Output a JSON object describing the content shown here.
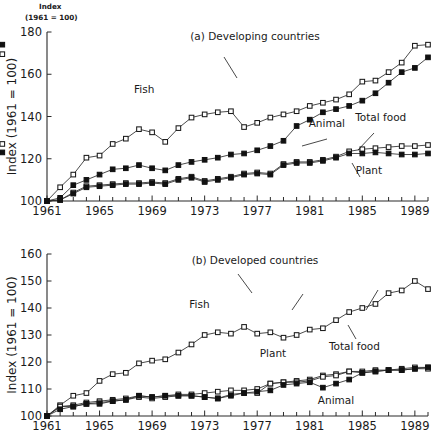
{
  "header": {
    "line1": "Index",
    "line2": "(1961 = 100)"
  },
  "chart_data": [
    {
      "type": "line",
      "id": "panel-a",
      "title": "(a) Developing countries",
      "xlabel": "",
      "ylabel": "Index (1961 = 100)",
      "xlim": [
        1961,
        1990
      ],
      "ylim": [
        100,
        180
      ],
      "yticks": [
        100,
        120,
        140,
        160,
        180
      ],
      "xticks": [
        1961,
        1965,
        1969,
        1973,
        1977,
        1981,
        1985,
        1989
      ],
      "xtick_labels": [
        "1961",
        "1965",
        "1969",
        "1973",
        "1977",
        "1981",
        "1985",
        "1989"
      ],
      "ytick_labels": [
        "100",
        "120",
        "140",
        "160",
        "180"
      ],
      "grid": false,
      "legend": "annotations",
      "x": [
        1961,
        1962,
        1963,
        1964,
        1965,
        1966,
        1967,
        1968,
        1969,
        1970,
        1971,
        1972,
        1973,
        1974,
        1975,
        1976,
        1977,
        1978,
        1979,
        1980,
        1981,
        1982,
        1983,
        1984,
        1985,
        1986,
        1987,
        1988,
        1989,
        1990
      ],
      "series": [
        {
          "name": "Fish",
          "marker": "open-square",
          "values": [
            100,
            106.5,
            112.5,
            120.5,
            121.5,
            127,
            129.5,
            134,
            132.5,
            128,
            134.5,
            139.5,
            141,
            142,
            142.5,
            135,
            137,
            139.5,
            141,
            142.5,
            145,
            146.5,
            148,
            150.5,
            156.5,
            157,
            161,
            165.5,
            173.5,
            174,
            169.5
          ]
        },
        {
          "name": "Animal",
          "marker": "filled-square",
          "values": [
            100,
            101.5,
            107.5,
            110,
            112.5,
            115,
            115.5,
            117,
            115.5,
            114.5,
            117,
            118.5,
            119.5,
            120.5,
            122,
            122.5,
            124,
            126,
            128.5,
            135.5,
            138.5,
            142,
            143.5,
            145,
            147.5,
            151,
            156,
            161,
            163,
            168,
            174
          ]
        },
        {
          "name": "Total food",
          "marker": "open-square",
          "values": [
            100,
            100.5,
            104,
            107,
            107.5,
            108,
            108.5,
            108.5,
            109,
            108.5,
            110.5,
            111.5,
            109.5,
            110.5,
            111.5,
            113,
            113.5,
            113,
            117.5,
            118.5,
            118.5,
            119.5,
            121,
            123.5,
            124.5,
            125,
            125.5,
            126,
            126,
            126.5,
            127
          ]
        },
        {
          "name": "Plant",
          "marker": "filled-square",
          "values": [
            100,
            100.5,
            103.5,
            106.5,
            107,
            107.5,
            108,
            108,
            108.5,
            108,
            110,
            111,
            109,
            110,
            111,
            112.5,
            113,
            112.5,
            117,
            118,
            118,
            119,
            120.5,
            122.5,
            122.5,
            123,
            122.5,
            122,
            122,
            122.5,
            123
          ]
        }
      ],
      "annotations": [
        {
          "text": "Fish",
          "x": 1968.4,
          "y": 151
        },
        {
          "text": "Animal",
          "x": 1982.3,
          "y": 135
        },
        {
          "text": "Total food",
          "x": 1986.4,
          "y": 138
        },
        {
          "text": "Plant",
          "x": 1985.5,
          "y": 113
        }
      ]
    },
    {
      "type": "line",
      "id": "panel-b",
      "title": "(b) Developed countries",
      "xlabel": "",
      "ylabel": "Index (1961 = 100)",
      "xlim": [
        1961,
        1990
      ],
      "ylim": [
        100,
        160
      ],
      "yticks": [
        100,
        110,
        120,
        130,
        140,
        150,
        160
      ],
      "xticks": [
        1961,
        1965,
        1969,
        1973,
        1977,
        1981,
        1985,
        1989
      ],
      "xtick_labels": [
        "1961",
        "1965",
        "1969",
        "1973",
        "1977",
        "1981",
        "1985",
        "1989"
      ],
      "ytick_labels": [
        "100",
        "110",
        "120",
        "130",
        "140",
        "150",
        "160"
      ],
      "grid": false,
      "legend": "annotations",
      "x": [
        1961,
        1962,
        1963,
        1964,
        1965,
        1966,
        1967,
        1968,
        1969,
        1970,
        1971,
        1972,
        1973,
        1974,
        1975,
        1976,
        1977,
        1978,
        1979,
        1980,
        1981,
        1982,
        1983,
        1984,
        1985,
        1986,
        1987,
        1988,
        1989,
        1990
      ],
      "series": [
        {
          "name": "Fish",
          "marker": "open-square",
          "values": [
            100,
            104,
            107.5,
            108.5,
            113,
            115.5,
            116,
            119.5,
            120.5,
            121,
            123.5,
            126.5,
            130,
            131,
            130.5,
            133,
            130.5,
            131,
            129,
            130,
            132,
            132.5,
            135.5,
            138.5,
            140,
            141.5,
            145.5,
            146.5,
            150,
            147
          ]
        },
        {
          "name": "Total food",
          "marker": "open-square",
          "values": [
            100,
            103.5,
            104,
            105,
            105.5,
            106,
            106.5,
            107.5,
            107,
            107.5,
            108,
            108,
            108.5,
            109,
            109.5,
            109.5,
            110,
            112,
            112.5,
            113,
            113.5,
            115,
            115.5,
            116.5,
            116.5,
            117,
            117,
            117.5,
            118,
            118
          ]
        },
        {
          "name": "Plant",
          "marker": "open-square",
          "values": [
            100,
            103.5,
            103.5,
            104.5,
            105,
            105.5,
            106,
            107,
            106.5,
            107,
            107.5,
            107.5,
            107,
            106.5,
            108,
            108.5,
            108.5,
            112,
            112.5,
            112.5,
            113,
            114.5,
            115,
            116.5,
            116,
            116.5,
            117,
            117,
            117.5,
            117.5
          ]
        },
        {
          "name": "Animal",
          "marker": "filled-square",
          "values": [
            100,
            102.5,
            103.5,
            104.5,
            104.5,
            105.5,
            106,
            107.5,
            107,
            107.5,
            107.5,
            107.5,
            107,
            106.5,
            107.5,
            108.5,
            109,
            109.5,
            111.5,
            112,
            112.5,
            110.5,
            112,
            113.5,
            116,
            116.5,
            117,
            117,
            117.5,
            118
          ]
        }
      ],
      "annotations": [
        {
          "text": "Fish",
          "x": 1972.6,
          "y": 140
        },
        {
          "text": "Plant",
          "x": 1978.2,
          "y": 122
        },
        {
          "text": "Total food",
          "x": 1984.4,
          "y": 124.5
        },
        {
          "text": "Animal",
          "x": 1983.0,
          "y": 104.5
        }
      ]
    }
  ]
}
